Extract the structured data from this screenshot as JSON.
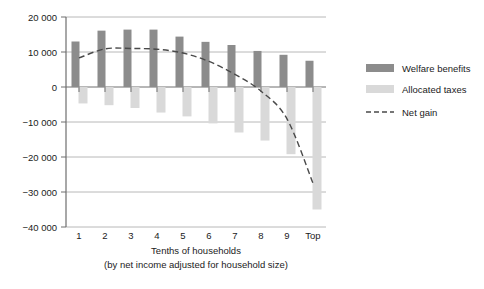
{
  "chart_data": {
    "type": "bar",
    "title": "",
    "subtitle": "",
    "xlabel": "Tenths of households",
    "xlabel_note": "(by net income adjusted for household size)",
    "ylabel": "",
    "categories": [
      "1",
      "2",
      "3",
      "4",
      "5",
      "6",
      "7",
      "8",
      "9",
      "Top"
    ],
    "ylim": [
      -40000,
      20000
    ],
    "yticks": [
      20000,
      10000,
      0,
      -10000,
      -20000,
      -30000,
      -40000
    ],
    "ytick_labels": [
      "20 000",
      "10 000",
      "0",
      "−10 000",
      "−20 000",
      "−30 000",
      "−40 000"
    ],
    "grid": true,
    "legend_position": "right",
    "series": [
      {
        "name": "Welfare benefits",
        "kind": "bar",
        "color": "#8c8c8c",
        "values": [
          13000,
          16100,
          16400,
          16400,
          14400,
          12900,
          12000,
          10300,
          9200,
          7500
        ]
      },
      {
        "name": "Allocated taxes",
        "kind": "bar",
        "color": "#d9d9d9",
        "values": [
          -4700,
          -5200,
          -6000,
          -7300,
          -8400,
          -10400,
          -13000,
          -15300,
          -19200,
          -35000
        ]
      },
      {
        "name": "Net gain",
        "kind": "line",
        "style": "dashed",
        "color": "#4a4a4a",
        "values": [
          8300,
          10900,
          11000,
          10800,
          9700,
          7300,
          3600,
          -1200,
          -9100,
          -27500
        ]
      }
    ]
  },
  "legend": {
    "items": [
      {
        "label": "Welfare benefits",
        "marker": "swatch-dark"
      },
      {
        "label": "Allocated taxes",
        "marker": "swatch-light"
      },
      {
        "label": "Net gain",
        "marker": "dashed-line"
      }
    ]
  },
  "colors": {
    "welfare_benefits": "#8c8c8c",
    "allocated_taxes": "#d9d9d9",
    "net_gain": "#4a4a4a",
    "axis": "#6e6e6e",
    "grid": "#b8b8b8",
    "background": "#ffffff",
    "text": "#1b1b1b"
  }
}
